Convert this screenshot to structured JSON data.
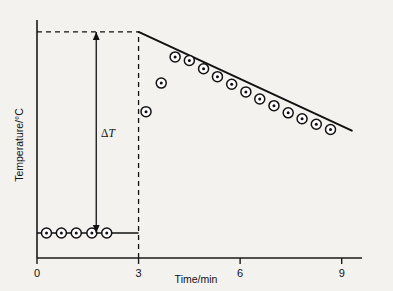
{
  "chart_data": {
    "type": "scatter",
    "title": "",
    "subtitle": "",
    "xlabel": "Time/min",
    "ylabel": "Temperature/°C",
    "xlim": [
      0,
      9.6
    ],
    "ylim": [
      0,
      10
    ],
    "grid": false,
    "legend_position": "none",
    "x_ticks": [
      0,
      3,
      6,
      9
    ],
    "x_tick_labels": [
      "0",
      "3",
      "6",
      "9"
    ],
    "y_ticks": [],
    "y_tick_labels": [],
    "annotations": [
      {
        "name": "delta-t-label",
        "text": "ΔT",
        "x": 1.8,
        "y": 5.2,
        "description": "Temperature rise between extrapolated baseline and extrapolated cooling line"
      },
      {
        "name": "delta-t-arrow",
        "type": "double-headed-arrow",
        "x": 1.75,
        "y_from": 1.05,
        "y_to": 9.5
      },
      {
        "name": "extrapolation-dashed-horizontal",
        "type": "dashed-line",
        "x_from": 0,
        "x_to": 3,
        "y": 9.5
      },
      {
        "name": "event-dashed-vertical",
        "type": "dashed-line",
        "x": 3,
        "y_from": 0,
        "y_to": 9.5
      },
      {
        "name": "baseline-segment",
        "type": "solid-line",
        "x_from": 0,
        "x_to": 3,
        "y": 1.05
      },
      {
        "name": "cooling-fit-line",
        "type": "solid-line",
        "x_from": 3,
        "x_to": 9.3,
        "y_from": 9.5,
        "y_to": 5.35
      }
    ],
    "series": [
      {
        "name": "baseline-readings",
        "marker": "circle-with-dot",
        "x": [
          0.28,
          0.72,
          1.16,
          1.62,
          2.06
        ],
        "y": [
          1.05,
          1.05,
          1.05,
          1.05,
          1.05
        ]
      },
      {
        "name": "post-event-readings",
        "marker": "circle-with-dot",
        "x": [
          3.22,
          3.67,
          4.08,
          4.5,
          4.92,
          5.33,
          5.75,
          6.17,
          6.58,
          7.0,
          7.42,
          7.83,
          8.25,
          8.67
        ],
        "y": [
          6.15,
          7.35,
          8.45,
          8.3,
          7.95,
          7.62,
          7.3,
          6.98,
          6.68,
          6.4,
          6.1,
          5.85,
          5.62,
          5.4
        ]
      }
    ]
  },
  "axes": {
    "x_title": "Time/min",
    "y_title": "Temperature/°C",
    "x_tick_labels": [
      "0",
      "3",
      "6",
      "9"
    ]
  },
  "labels": {
    "delta_t": "ΔT"
  },
  "colors": {
    "ink": "#111111",
    "paper": "#f4f2ef",
    "marker_fill": "#ffffff"
  }
}
